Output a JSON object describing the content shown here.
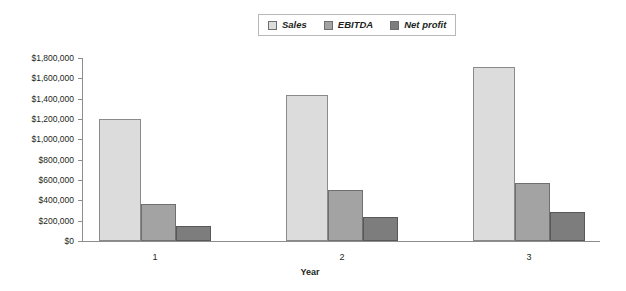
{
  "chart_data": {
    "type": "bar",
    "title": "",
    "xlabel": "Year",
    "ylabel": "",
    "categories": [
      "1",
      "2",
      "3"
    ],
    "series": [
      {
        "name": "Sales",
        "values": [
          1200000,
          1440000,
          1710000
        ],
        "color": "#dcdcdc"
      },
      {
        "name": "EBITDA",
        "values": [
          360000,
          500000,
          570000
        ],
        "color": "#a3a3a3"
      },
      {
        "name": "Net profit",
        "values": [
          150000,
          240000,
          285000
        ],
        "color": "#7d7d7d"
      }
    ],
    "ylim": [
      0,
      1800000
    ],
    "ytick_values": [
      0,
      200000,
      400000,
      600000,
      800000,
      1000000,
      1200000,
      1400000,
      1600000,
      1800000
    ],
    "ytick_labels": [
      "$0",
      "$200,000",
      "$400,000",
      "$600,000",
      "$800,000",
      "$1,000,000",
      "$1,200,000",
      "$1,400,000",
      "$1,600,000",
      "$1,800,000"
    ],
    "grid": false,
    "legend_position": "top-center",
    "legend_entries": [
      "Sales",
      "EBITDA",
      "Net profit"
    ]
  },
  "plot_geometry": {
    "y_top_px": 58,
    "y_base_px": 241,
    "x_axis_start_px": 82,
    "x_axis_end_px": 600,
    "group_start_px": 99,
    "group_pitch_px": 187,
    "bar_widths_px": [
      42,
      35,
      35
    ]
  }
}
